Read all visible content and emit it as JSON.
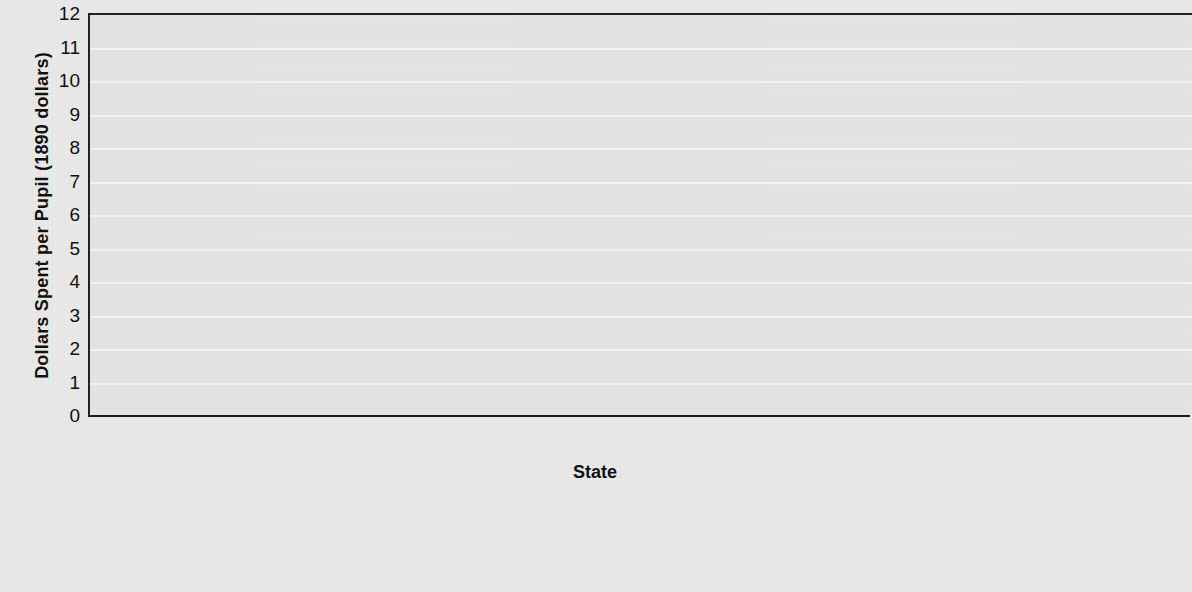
{
  "chart_data": {
    "type": "bar",
    "title": "",
    "xlabel": "State",
    "ylabel": "Dollars Spent per Pupil (1890 dollars)",
    "ylim": [
      0,
      12
    ],
    "yticks": [
      12,
      11,
      10,
      9,
      8,
      7,
      6,
      5,
      4,
      3,
      2,
      1,
      0
    ],
    "grid": true,
    "legend_position": "below",
    "categories": [
      "Alabama",
      "Florida",
      "Louisiana",
      "North Carolina",
      "Virginia"
    ],
    "series": [
      {
        "name": "For white students 1890",
        "group": "For white students",
        "year": "1890",
        "shade": "light",
        "values": [
          3.1,
          9.4,
          5.85,
          2.7,
          7.1
        ]
      },
      {
        "name": "For white students 1910",
        "group": "For white students",
        "year": "1910",
        "shade": "dark",
        "values": [
          10.05,
          11.6,
          11.5,
          5.2,
          11.6
        ]
      },
      {
        "name": "For black students 1890",
        "group": "For black students",
        "year": "1890",
        "shade": "light",
        "values": [
          3.05,
          4.6,
          2.9,
          2.75,
          4.9
        ]
      },
      {
        "name": "For black students 1910",
        "group": "For black students",
        "year": "1910",
        "shade": "dark",
        "values": [
          2.7,
          3.1,
          2.1,
          2.5,
          4.05
        ]
      }
    ]
  },
  "axes": {
    "y_title": "Dollars Spent per Pupil (1890 dollars)",
    "x_title": "State",
    "ticks": [
      "12",
      "11",
      "10",
      "9",
      "8",
      "7",
      "6",
      "5",
      "4",
      "3",
      "2",
      "1",
      "0"
    ]
  },
  "categories": [
    {
      "label": "Alabama"
    },
    {
      "label": "Florida"
    },
    {
      "label": "Louisiana"
    },
    {
      "label": "North Carolina"
    },
    {
      "label": "Virginia"
    }
  ],
  "legend": [
    {
      "title": "For white students",
      "entries": [
        {
          "label": "1890",
          "shade": "light"
        },
        {
          "label": "1910",
          "shade": "dark"
        }
      ]
    },
    {
      "title": "For black students",
      "entries": [
        {
          "label": "1890",
          "shade": "light"
        },
        {
          "label": "1910",
          "shade": "dark"
        }
      ]
    }
  ],
  "colors": {
    "light_bar": "#adadad",
    "dark_bar": "#797979",
    "plot_background": "#e4e4e4",
    "page_background": "#e9e9e9",
    "axis": "#1b1b1b",
    "gridline": "#f4f4f4"
  }
}
